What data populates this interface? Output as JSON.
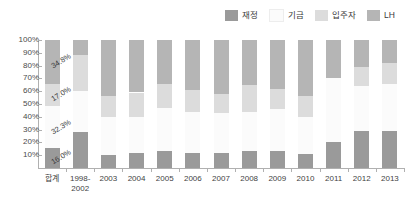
{
  "legend": {
    "position": "top-right",
    "items": [
      {
        "label": "재정",
        "color": "#9a9a9a",
        "key": "fiscal"
      },
      {
        "label": "기금",
        "color": "#fbfbfb",
        "key": "fund"
      },
      {
        "label": "입주자",
        "color": "#dcdcdc",
        "key": "tenant"
      },
      {
        "label": "LH",
        "color": "#b5b5b5",
        "key": "lh"
      }
    ]
  },
  "axis": {
    "y_ticks": [
      "100%",
      "90%",
      "80%",
      "70%",
      "60%",
      "50%",
      "40%",
      "30%",
      "20%",
      "10%"
    ],
    "x_labels": [
      "합계",
      "1998-\n2002",
      "2003",
      "2004",
      "2005",
      "2006",
      "2007",
      "2008",
      "2009",
      "2010",
      "2011",
      "2012",
      "2013"
    ]
  },
  "data_labels": [
    {
      "text": "34.8%",
      "x": 52,
      "y": 62
    },
    {
      "text": "17.0%",
      "x": 52,
      "y": 95
    },
    {
      "text": "32.3%",
      "x": 52,
      "y": 128
    },
    {
      "text": "16.0%",
      "x": 52,
      "y": 158
    }
  ],
  "chart_data": {
    "type": "bar",
    "subtype": "stacked-100-percent",
    "title": "",
    "xlabel": "",
    "ylabel": "",
    "ylim": [
      0,
      100
    ],
    "ytick_step": 10,
    "grid": false,
    "legend_position": "top-right",
    "categories": [
      "합계",
      "1998-2002",
      "2003",
      "2004",
      "2005",
      "2006",
      "2007",
      "2008",
      "2009",
      "2010",
      "2011",
      "2012",
      "2013"
    ],
    "series": [
      {
        "name": "재정",
        "color": "#9a9a9a",
        "stack_order": 1,
        "values": [
          16.0,
          28.0,
          10.0,
          12.0,
          13.0,
          12.0,
          12.0,
          13.0,
          13.0,
          11.0,
          20.0,
          29.0,
          29.0
        ]
      },
      {
        "name": "기금",
        "color": "#fbfbfb",
        "stack_order": 2,
        "values": [
          32.3,
          32.0,
          30.0,
          28.0,
          34.0,
          32.0,
          31.0,
          31.0,
          33.0,
          29.0,
          50.0,
          35.0,
          37.0
        ]
      },
      {
        "name": "입주자",
        "color": "#dcdcdc",
        "stack_order": 3,
        "values": [
          17.0,
          28.0,
          16.0,
          19.0,
          19.0,
          17.0,
          15.0,
          21.0,
          16.0,
          16.0,
          0.0,
          15.0,
          16.0
        ]
      },
      {
        "name": "LH",
        "color": "#b5b5b5",
        "stack_order": 4,
        "values": [
          34.8,
          12.0,
          44.0,
          41.0,
          34.0,
          39.0,
          42.0,
          35.0,
          38.0,
          44.0,
          30.0,
          21.0,
          18.0
        ]
      }
    ],
    "annotations": [
      {
        "text": "34.8%",
        "series": "LH",
        "category": "합계"
      },
      {
        "text": "17.0%",
        "series": "입주자",
        "category": "합계"
      },
      {
        "text": "32.3%",
        "series": "기금",
        "category": "합계"
      },
      {
        "text": "16.0%",
        "series": "재정",
        "category": "합계"
      }
    ]
  }
}
